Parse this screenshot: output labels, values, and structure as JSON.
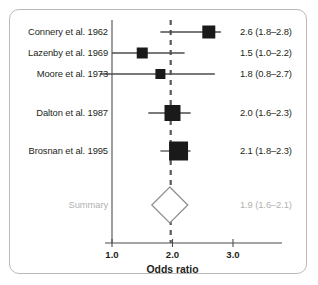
{
  "figure": {
    "title": "",
    "axis_title": "Odds ratio",
    "frame_color": "#b9b9b9",
    "text_color": "#231f20",
    "summary_color": "#b2b2b2",
    "marker_color": "#1a1a1a",
    "line_color": "#4d4d4d",
    "reference_line_color": "#595959"
  },
  "chart_data": {
    "type": "forest",
    "title": "",
    "xlabel": "Odds ratio",
    "ylabel": "",
    "xlim": [
      0.72,
      3.45
    ],
    "xticks": [
      1.0,
      2.0,
      3.0
    ],
    "xtick_labels": [
      "1.0",
      "2.0",
      "3.0"
    ],
    "grid": false,
    "legend": "none",
    "reference_line": 1.97,
    "reference_line_style": "dashed",
    "rows": [
      {
        "label": "Connery et al. 1962",
        "estimate": 2.6,
        "ci_low": 1.8,
        "ci_high": 2.8,
        "value_text": "2.6 (1.8–2.8)",
        "marker": "square",
        "marker_size": 13,
        "is_summary": false
      },
      {
        "label": "Lazenby et al. 1969",
        "estimate": 1.5,
        "ci_low": 1.0,
        "ci_high": 2.2,
        "value_text": "1.5 (1.0–2.2)",
        "marker": "square",
        "marker_size": 11,
        "is_summary": false
      },
      {
        "label": "Moore et al. 1973",
        "estimate": 1.8,
        "ci_low": 0.8,
        "ci_high": 2.7,
        "value_text": "1.8 (0.8–2.7)",
        "marker": "square",
        "marker_size": 10,
        "is_summary": false
      },
      {
        "label": "Dalton et al. 1987",
        "estimate": 2.0,
        "ci_low": 1.6,
        "ci_high": 2.3,
        "value_text": "2.0 (1.6–2.3)",
        "marker": "square",
        "marker_size": 16,
        "is_summary": false
      },
      {
        "label": "Brosnan et al. 1995",
        "estimate": 2.1,
        "ci_low": 1.8,
        "ci_high": 2.3,
        "value_text": "2.1 (1.8–2.3)",
        "marker": "square",
        "marker_size": 19,
        "is_summary": false
      },
      {
        "label": "Summary",
        "estimate": 1.9,
        "ci_low": 1.6,
        "ci_high": 2.1,
        "value_text": "1.9 (1.6–2.1)",
        "marker": "diamond",
        "marker_size": 36,
        "is_summary": true
      }
    ]
  }
}
